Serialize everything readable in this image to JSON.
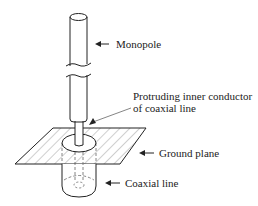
{
  "diagram": {
    "labels": {
      "monopole": "Monopole",
      "protruding_line1": "Protruding inner conductor",
      "protruding_line2": "of coaxial line",
      "ground_plane": "Ground plane",
      "coaxial_line": "Coaxial line"
    },
    "colors": {
      "stroke": "#222222",
      "hatch": "#888888",
      "dashed": "#666666",
      "background": "#ffffff"
    }
  }
}
